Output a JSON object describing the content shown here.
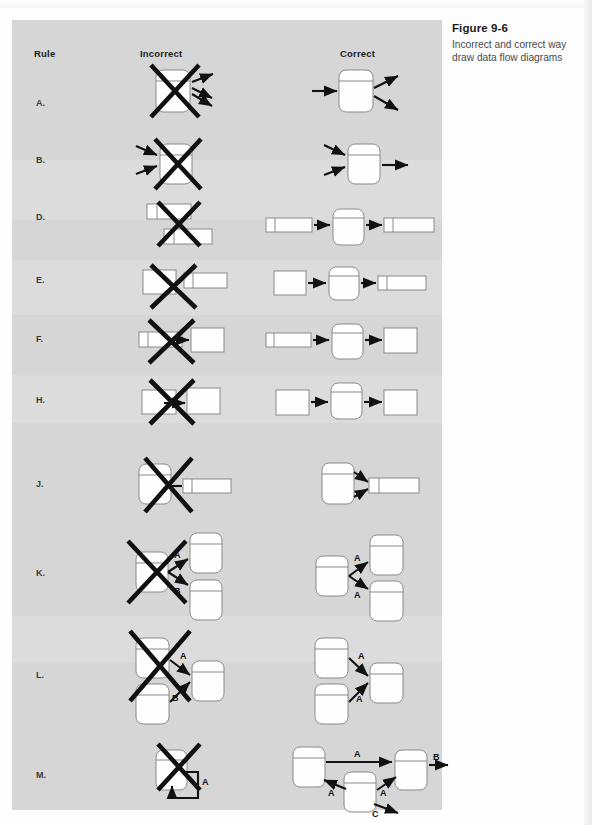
{
  "figure": {
    "caption_title": "Figure 9-6",
    "caption_line1": "Incorrect and correct way",
    "caption_line2": "draw data flow diagrams"
  },
  "columns": {
    "rule": "Rule",
    "incorrect": "Incorrect",
    "correct": "Correct"
  },
  "rows": [
    {
      "label": "A.",
      "incorrect": "process with only outgoing flows, crossed out",
      "correct": "process with one incoming flow and two outgoing flows"
    },
    {
      "label": "B.",
      "incorrect": "process with only incoming flows, crossed out",
      "correct": "process with two incoming flows and one outgoing flow"
    },
    {
      "label": "D.",
      "incorrect": "data store connected directly to data store, crossed out",
      "correct": "data store to process to data store"
    },
    {
      "label": "E.",
      "incorrect": "external entity connected directly to data store, crossed out",
      "correct": "external entity to process to data store"
    },
    {
      "label": "F.",
      "incorrect": "data store connected directly to external entity, crossed out",
      "correct": "data store to process to external entity"
    },
    {
      "label": "H.",
      "incorrect": "external entity connected directly to external entity, crossed out",
      "correct": "external entity to process to external entity"
    },
    {
      "label": "J.",
      "incorrect": "two-headed flow between process and data store, crossed out",
      "correct": "two separate flows between process and data store"
    },
    {
      "label": "K.",
      "incorrect": "one process splitting into flows A and B, crossed out",
      "correct": "one process sending flow A to two processes"
    },
    {
      "label": "L.",
      "incorrect": "two processes sending flows A and B into one process, crossed out",
      "correct": "two processes each sending flow A into one process"
    },
    {
      "label": "M.",
      "incorrect": "process with a flow A looping back to itself, crossed out",
      "correct": "flow A between processes with flows A, B and C"
    }
  ],
  "flow_labels": {
    "a": "A",
    "b": "B",
    "c": "C"
  },
  "colors": {
    "panel_background": "#d6d6d6",
    "page_background": "#fdfdfd",
    "symbol_fill": "#fefefe",
    "symbol_stroke": "#8a8a8a",
    "flow_stroke": "#111111",
    "caption_title": "#1a1a1a",
    "caption_text": "#4a4a4a"
  }
}
